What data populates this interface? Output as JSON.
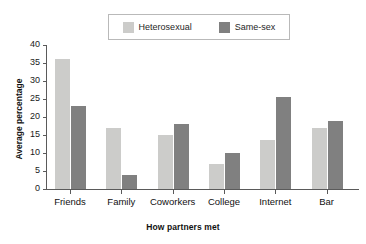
{
  "chart_data": {
    "type": "bar",
    "title": "",
    "subtitle": "",
    "xlabel": "How partners met",
    "ylabel": "Average percentage",
    "categories": [
      "Friends",
      "Family",
      "Coworkers",
      "College",
      "Internet",
      "Bar"
    ],
    "series": [
      {
        "name": "Heterosexual",
        "color": "#ccccca",
        "values": [
          36,
          17,
          15,
          7,
          13.5,
          17
        ]
      },
      {
        "name": "Same-sex",
        "color": "#808080",
        "values": [
          23,
          4,
          18,
          10,
          25.5,
          19
        ]
      }
    ],
    "ylim": [
      0,
      40
    ],
    "ytick_values": [
      0,
      5,
      10,
      15,
      20,
      25,
      30,
      35,
      40
    ],
    "ytick_labels": [
      "0",
      "5",
      "10",
      "15",
      "20",
      "25",
      "30",
      "35",
      "40"
    ],
    "grid": false,
    "legend_position": "top-center",
    "legend_boxed": true,
    "axis_color": "#5a5a5a",
    "background_color": "#ffffff"
  },
  "legend": {
    "entries": [
      {
        "label": "Heterosexual",
        "color": "#ccccca"
      },
      {
        "label": "Same-sex",
        "color": "#808080"
      }
    ]
  }
}
